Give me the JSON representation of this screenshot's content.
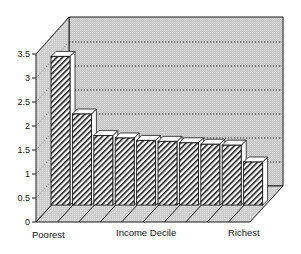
{
  "chart_data": {
    "type": "bar",
    "style": "3d-bar",
    "title": "",
    "xlabel": "Income Decile",
    "ylabel": "",
    "x_end_labels": {
      "left": "Poorest",
      "right": "Richest"
    },
    "categories": [
      "1",
      "2",
      "3",
      "4",
      "5",
      "6",
      "7",
      "8",
      "9",
      "10"
    ],
    "values": [
      3.45,
      2.25,
      1.8,
      1.75,
      1.7,
      1.68,
      1.65,
      1.62,
      1.6,
      1.25
    ],
    "yticks": [
      0,
      0.5,
      1,
      1.5,
      2,
      2.5,
      3,
      3.5
    ],
    "ytick_labels": [
      "0",
      "0.5",
      "1",
      "1.5",
      "2",
      "2.5",
      "3",
      "3.5"
    ],
    "ylim": [
      0,
      3.5
    ],
    "grid": true,
    "grid_style": "dotted",
    "legend": null,
    "colors": {
      "back_wall": "#c9c9c9",
      "side_wall": "#d2d2d2",
      "floor": "#cdcdcd",
      "bar_fill": "#ffffff",
      "bar_hatch": "#1a1a1a",
      "outline": "#1a1a1a"
    }
  }
}
